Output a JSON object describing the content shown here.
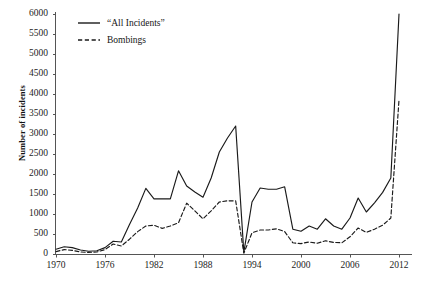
{
  "chart_data": {
    "type": "line",
    "title": "",
    "subtitle": "",
    "xlabel": "",
    "ylabel": "Number of incidents",
    "xlim": [
      1970,
      2012
    ],
    "ylim": [
      0,
      6000
    ],
    "grid": false,
    "legend_position": "top-left",
    "xticks": [
      "1970",
      "1976",
      "1982",
      "1988",
      "1994",
      "2000",
      "2006",
      "2012"
    ],
    "xtick_values": [
      1970,
      1976,
      1982,
      1988,
      1994,
      2000,
      2006,
      2012
    ],
    "yticks": [
      "0",
      "500",
      "1000",
      "1500",
      "2000",
      "2500",
      "3000",
      "3500",
      "4000",
      "4500",
      "5000",
      "5500",
      "6000"
    ],
    "ytick_values": [
      0,
      500,
      1000,
      1500,
      2000,
      2500,
      3000,
      3500,
      4000,
      4500,
      5000,
      5500,
      6000
    ],
    "x": [
      1970,
      1971,
      1972,
      1973,
      1974,
      1975,
      1976,
      1977,
      1978,
      1979,
      1980,
      1981,
      1982,
      1983,
      1984,
      1985,
      1986,
      1987,
      1988,
      1989,
      1990,
      1991,
      1992,
      1993,
      1994,
      1995,
      1996,
      1997,
      1998,
      1999,
      2000,
      2001,
      2002,
      2003,
      2004,
      2005,
      2006,
      2007,
      2008,
      2009,
      2010,
      2011,
      2012
    ],
    "series": [
      {
        "name": "“All Incidents”",
        "style": "solid",
        "color": "#1a1a1a",
        "values": [
          120,
          180,
          160,
          100,
          70,
          80,
          160,
          320,
          300,
          740,
          1150,
          1640,
          1380,
          1380,
          1380,
          2080,
          1700,
          1550,
          1420,
          1900,
          2550,
          2900,
          3200,
          40,
          1300,
          1650,
          1620,
          1620,
          1680,
          620,
          570,
          700,
          620,
          880,
          700,
          620,
          900,
          1400,
          1050,
          1280,
          1540,
          1900,
          6000
        ]
      },
      {
        "name": "Bombings",
        "style": "dashed",
        "color": "#1a1a1a",
        "values": [
          60,
          110,
          90,
          50,
          40,
          50,
          110,
          250,
          200,
          370,
          560,
          700,
          720,
          640,
          700,
          780,
          1270,
          1080,
          880,
          1080,
          1300,
          1330,
          1330,
          20,
          530,
          600,
          600,
          630,
          560,
          280,
          260,
          300,
          270,
          330,
          290,
          280,
          430,
          650,
          540,
          620,
          720,
          900,
          3850
        ]
      }
    ]
  },
  "legend": {
    "items": [
      {
        "label": "“All Incidents”",
        "style": "solid"
      },
      {
        "label": "Bombings",
        "style": "dashed"
      }
    ]
  },
  "axes": {
    "y_title": "Number of incidents"
  }
}
